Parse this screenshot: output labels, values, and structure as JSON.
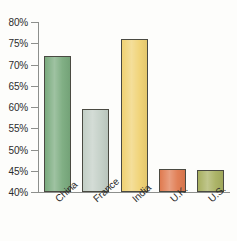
{
  "chart_data": {
    "type": "bar",
    "title": "",
    "subtitle": "",
    "xlabel": "",
    "ylabel": "",
    "categories": [
      "China",
      "France",
      "India",
      "U.K.",
      "U.S."
    ],
    "values": [
      72.0,
      59.5,
      76.0,
      45.4,
      45.1
    ],
    "value_suffix": "%",
    "ylim": [
      40,
      80
    ],
    "yticks": [
      40,
      45,
      50,
      55,
      60,
      65,
      70,
      75,
      80
    ],
    "ytick_labels": [
      "40%",
      "45%",
      "50%",
      "55%",
      "60%",
      "65%",
      "70%",
      "75%",
      "80%"
    ],
    "grid": false,
    "legend": false,
    "legend_position": "none",
    "bar_colors": [
      "#7aab7e",
      "#c3cfc6",
      "#f0d273",
      "#e07a4f",
      "#a8b060"
    ],
    "bar_border_color": "#4a4a42",
    "axis_color": "#8d8f8c",
    "background_color": "#fdfdfb",
    "text_color": "#2c2c2c"
  }
}
